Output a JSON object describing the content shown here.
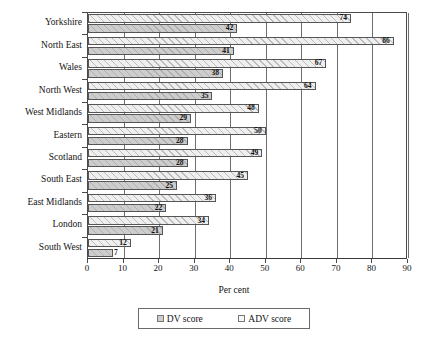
{
  "chart_data": {
    "type": "bar",
    "orientation": "horizontal",
    "title": "",
    "xlabel": "Per cent",
    "ylabel": "",
    "xlim": [
      0,
      90
    ],
    "xticks": [
      0,
      10,
      20,
      30,
      40,
      50,
      60,
      70,
      80,
      90
    ],
    "grid": true,
    "grid_axis": "x",
    "legend_position": "bottom-center",
    "categories": [
      "Yorkshire",
      "North East",
      "Wales",
      "North West",
      "West Midlands",
      "Eastern",
      "Scotland",
      "South East",
      "East Midlands",
      "London",
      "South West"
    ],
    "series": [
      {
        "name": "ADV score",
        "swatch": "adv",
        "values": [
          74,
          86,
          67,
          64,
          48,
          50,
          49,
          45,
          36,
          34,
          12
        ]
      },
      {
        "name": "DV score",
        "swatch": "dv",
        "values": [
          42,
          41,
          38,
          35,
          29,
          28,
          28,
          25,
          22,
          21,
          7
        ]
      }
    ]
  },
  "legend": {
    "entries": [
      {
        "label": "DV score",
        "swatch": "dv"
      },
      {
        "label": "ADV score",
        "swatch": "adv"
      }
    ]
  },
  "axis": {
    "x_title": "Per cent"
  }
}
